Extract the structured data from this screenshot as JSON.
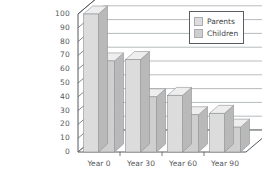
{
  "chart_data": {
    "type": "bar",
    "title": "",
    "subtitle": "",
    "xlabel": "",
    "ylabel": "",
    "categories": [
      "Year 0",
      "Year 30",
      "Year 60",
      "Year 90"
    ],
    "series": [
      {
        "name": "Parents",
        "values": [
          100,
          67,
          41,
          28
        ],
        "color": "#dcdcdc"
      },
      {
        "name": "Children",
        "values": [
          66,
          40,
          27,
          18
        ],
        "color": "#cfcfcf"
      }
    ],
    "ylim": [
      0,
      100
    ],
    "yticks": [
      0,
      10,
      20,
      30,
      40,
      50,
      60,
      70,
      80,
      90,
      100
    ],
    "ytick_labels": [
      "0",
      "10",
      "20",
      "30",
      "40",
      "50",
      "60",
      "70",
      "80",
      "90",
      "100"
    ],
    "grid": true,
    "grid_axis": "y",
    "legend_position": "top-right",
    "projection": "3d",
    "background_color": "#ffffff",
    "axis_color": "#55585c",
    "grid_color": "#9a9da1"
  },
  "legend": {
    "entries": [
      {
        "label": "Parents",
        "swatch": "parents-swatch"
      },
      {
        "label": "Children",
        "swatch": "children-swatch"
      }
    ]
  }
}
